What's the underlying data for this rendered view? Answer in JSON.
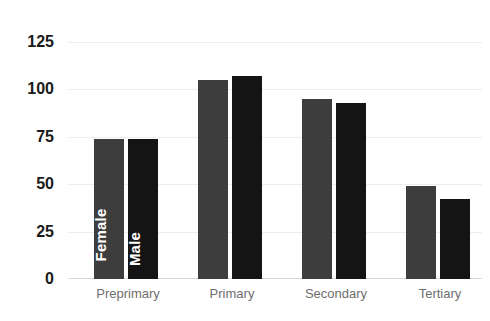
{
  "title_remnant": "",
  "axis": {
    "y_ticks": [
      "125",
      "100",
      "75",
      "50",
      "25",
      "0"
    ],
    "x_labels": [
      "Preprimary",
      "Primary",
      "Secondary",
      "Tertiary"
    ]
  },
  "series_labels": {
    "female": "Female",
    "male": "Male"
  },
  "colors": {
    "female": "#3d3d3d",
    "male": "#141414",
    "gridline": "#ededed",
    "baseline": "#d8d8d8",
    "tick_text": "#1a1a1a",
    "category_text": "#6e6e6e",
    "in_bar_text": "#ffffff",
    "background": "#ffffff"
  },
  "chart_data": {
    "type": "bar",
    "title": "",
    "subtitle": "",
    "xlabel": "",
    "ylabel": "",
    "categories": [
      "Preprimary",
      "Primary",
      "Secondary",
      "Tertiary"
    ],
    "series": [
      {
        "name": "Female",
        "values": [
          74,
          105,
          95,
          49
        ],
        "color": "#3d3d3d"
      },
      {
        "name": "Male",
        "values": [
          74,
          107,
          93,
          42
        ],
        "color": "#141414"
      }
    ],
    "ylim": [
      0,
      125
    ],
    "ytick_values": [
      0,
      25,
      50,
      75,
      100,
      125
    ],
    "grid": true,
    "grid_axis": "y",
    "legend": "in-bar",
    "legend_position": "inside-first-group",
    "annotations": [
      {
        "text": "Female",
        "placement": "inside first Preprimary bar, rotated 90deg"
      },
      {
        "text": "Male",
        "placement": "inside second Preprimary bar, rotated 90deg"
      }
    ]
  }
}
